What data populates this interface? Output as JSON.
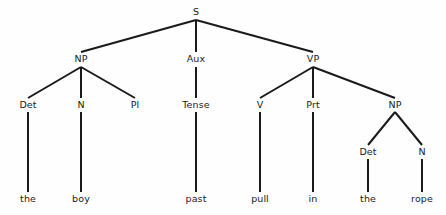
{
  "figure": {
    "type": "syntax-tree",
    "title": "",
    "sentence": "the boy past pull in the rope",
    "background_color": "#fefefe",
    "line_color": "#1a1a1a",
    "text_color": "#1a1a1a"
  },
  "nodes": {
    "s": "S",
    "np_subject": "NP",
    "aux": "Aux",
    "vp": "VP",
    "det1": "Det",
    "n1": "N",
    "pl": "Pl",
    "tense": "Tense",
    "v": "V",
    "prt": "Prt",
    "np_object": "NP",
    "det2": "Det",
    "n2": "N"
  },
  "leaves": {
    "the1": "the",
    "boy": "boy",
    "past": "past",
    "pull": "pull",
    "in": "in",
    "the2": "the",
    "rope": "rope"
  },
  "layout": {
    "levels": [
      12,
      59,
      105,
      152,
      199
    ],
    "x": {
      "s": 196,
      "np_subject": 81,
      "aux": 196,
      "vp": 313,
      "det1": 28,
      "n1": 81,
      "pl": 135,
      "tense": 196,
      "v": 260,
      "prt": 313,
      "np_object": 395,
      "det2": 368,
      "n2": 422
    }
  }
}
